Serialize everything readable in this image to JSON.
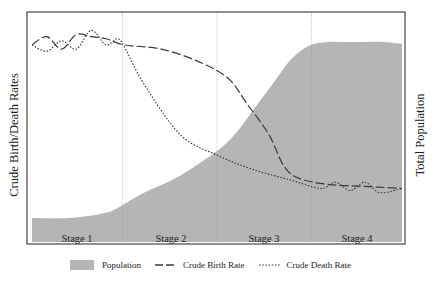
{
  "chart_data": {
    "type": "area",
    "title": "",
    "xlabel": "",
    "ylabel": "Crude Birth/Death Rates",
    "ylabel_right": "Total Population",
    "categories": [
      "Stage 1",
      "Stage 2",
      "Stage 3",
      "Stage 4"
    ],
    "stage_boundaries_x_fraction": [
      0.25,
      0.5,
      0.75
    ],
    "grid": false,
    "legend_position": "bottom",
    "colors": {
      "population_fill": "#b5b5b5",
      "line": "#3a3a3a",
      "frame": "#555555",
      "stage_divider": "#9a9a9a"
    },
    "series": [
      {
        "name": "Population",
        "style": "area",
        "axis": "right",
        "x": [
          0.0,
          0.1,
          0.2,
          0.25,
          0.3,
          0.4,
          0.5,
          0.55,
          0.6,
          0.65,
          0.7,
          0.75,
          0.8,
          0.85,
          0.9,
          0.95,
          1.0
        ],
        "values": [
          0.0,
          0.0,
          0.03,
          0.08,
          0.14,
          0.24,
          0.38,
          0.48,
          0.62,
          0.76,
          0.9,
          0.98,
          1.0,
          1.0,
          1.0,
          1.0,
          0.99
        ]
      },
      {
        "name": "Crude Birth Rate",
        "style": "dashed",
        "axis": "left",
        "x": [
          0.0,
          0.04,
          0.08,
          0.12,
          0.16,
          0.2,
          0.25,
          0.35,
          0.45,
          0.53,
          0.58,
          0.64,
          0.68,
          0.72,
          0.8,
          0.9,
          1.0
        ],
        "values": [
          0.88,
          0.92,
          0.86,
          0.93,
          0.92,
          0.91,
          0.88,
          0.86,
          0.8,
          0.72,
          0.6,
          0.45,
          0.3,
          0.24,
          0.21,
          0.2,
          0.19
        ]
      },
      {
        "name": "Crude Death Rate",
        "style": "dotted",
        "axis": "left",
        "x": [
          0.0,
          0.04,
          0.08,
          0.12,
          0.16,
          0.2,
          0.23,
          0.25,
          0.3,
          0.4,
          0.5,
          0.6,
          0.7,
          0.78,
          0.82,
          0.86,
          0.9,
          0.94,
          1.0
        ],
        "values": [
          0.88,
          0.85,
          0.9,
          0.86,
          0.95,
          0.88,
          0.91,
          0.87,
          0.7,
          0.45,
          0.35,
          0.28,
          0.23,
          0.19,
          0.22,
          0.18,
          0.22,
          0.17,
          0.19
        ]
      }
    ]
  },
  "axes": {
    "left_label": "Crude Birth/Death Rates",
    "right_label": "Total Population"
  },
  "stages": [
    "Stage 1",
    "Stage 2",
    "Stage 3",
    "Stage 4"
  ],
  "legend": {
    "population": "Population",
    "birth_rate": "Crude Birth Rate",
    "death_rate": "Crude Death Rate"
  }
}
